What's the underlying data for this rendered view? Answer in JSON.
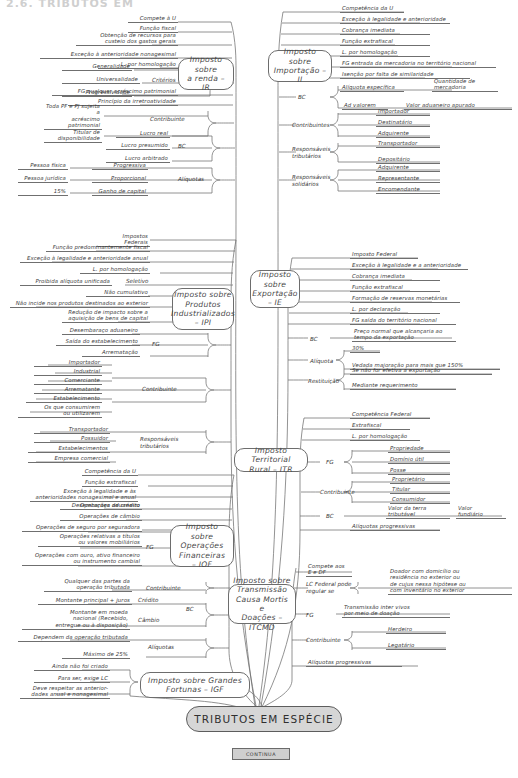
{
  "page": {
    "title_partial": "2.6. TRIBUTOS EM",
    "root_label": "TRIBUTOS EM ESPÉCIE",
    "continua_label": "CONTINUA"
  },
  "colors": {
    "ink": "#3a3a3a",
    "line": "#6f6f6f",
    "root_fill": "#d6d6d6",
    "continua_fill": "#cfcfcf",
    "paper": "#ffffff"
  },
  "branches": [
    {
      "id": "ir",
      "topic": "Imposto sobre\na renda – IR",
      "items": [
        "Compete à U",
        "Função fiscal",
        "Obtenção de recursos para\ncusteio dos gastos gerais",
        "Exceção à anterioridade nonagesimal",
        "L. por homologação",
        "FG qualquer acréscimo patrimonial",
        "Princípio da irretroatividade"
      ],
      "groups": [
        {
          "label": "Critérios",
          "children": [
            "Generalidade",
            "Universalidade",
            "Progressividade"
          ]
        },
        {
          "label": "Contribuinte",
          "children": [
            "Toda PF e PJ sujeita a\nacréscimo patrimonial",
            "Titular de disponibilidade"
          ]
        },
        {
          "label": "BC",
          "children": [
            "Lucro real",
            "Lucro presumido",
            "Lucro arbitrado"
          ]
        },
        {
          "label": "Alíquotas",
          "children": [
            "Progressiva",
            "Proporcional",
            "Ganho de capital"
          ]
        }
      ],
      "sub_leaves": [
        "Pessoa física",
        "Pessoa jurídica",
        "15%"
      ]
    },
    {
      "id": "ii",
      "topic": "Imposto sobre\nImportação – II",
      "items": [
        "Competência da U",
        "Exceção à legalidade e anterioridade",
        "Cobrança imediata",
        "Função extrafiscal",
        "L. por homologação",
        "FG entrada da mercadoria no território nacional",
        "Isenção por falta de similaridade"
      ],
      "groups": [
        {
          "label": "BC",
          "children": [
            "Alíquota específica",
            "Ad valorem"
          ],
          "values": [
            "Quantidade de\nmercadoria",
            "Valor aduaneiro apurado"
          ]
        },
        {
          "label": "Contribuintes",
          "children": [
            "Importador",
            "Destinatário",
            "Adquirente"
          ]
        },
        {
          "label": "Responsáveis\ntributários",
          "children": [
            "Transportador",
            "Depositário"
          ]
        },
        {
          "label": "Responsáveis\nsolidários",
          "children": [
            "Adquirente",
            "Representante",
            "Encomendante"
          ]
        }
      ]
    },
    {
      "id": "ipi",
      "topic": "Imposto sobre\nProdutos\nIndustrializados\n– IPI",
      "items": [
        "Impostos Federais",
        "Função predominantemente fiscal",
        "Exceção à legalidade e anterioridade anual",
        "L. por homologação",
        "Não cumulativo",
        "Não incide nos produtos destinados ao exterior",
        "Redução de impacto sobre a\naquisição de bens de capital"
      ],
      "pair": {
        "left": "Proibida alíquota unificada",
        "right": "Seletivo"
      },
      "groups": [
        {
          "label": "FG",
          "children": [
            "Desembaraço aduaneiro",
            "Saída do estabelecimento",
            "Arrematação"
          ]
        },
        {
          "label": "Contribuinte",
          "children": [
            "Importador",
            "Industrial",
            "Comerciante",
            "Arrematante",
            "Estabelecimento",
            "Os que consumirem\nou utilizarem"
          ]
        },
        {
          "label": "Responsáveis\ntributários",
          "children": [
            "Transportador",
            "Possuidor",
            "Estabelecimentos",
            "Empresa comercial"
          ]
        }
      ]
    },
    {
      "id": "ie",
      "topic": "Imposto\nsobre\nExportação\n– IE",
      "items": [
        "Imposto Federal",
        "Exceção à legalidade e a anterioridade",
        "Cobrança imediata",
        "Função extrafiscal",
        "Formação de reservas monetárias",
        "L. por declaração",
        "FG saída do território nacional"
      ],
      "groups": [
        {
          "label": "BC",
          "children": [
            "Preço normal que alcançaria ao\ntempo da exportação"
          ]
        },
        {
          "label": "Alíquota",
          "children": [
            "30%",
            "Vedada majoração para mais que 150%"
          ]
        },
        {
          "label": "Restituição",
          "children": [
            "Se não for efetiva a exportação",
            "Mediante requerimento"
          ]
        }
      ]
    },
    {
      "id": "itr",
      "topic": "Imposto Territorial\nRural – ITR",
      "items": [
        "Competência Federal",
        "Extrafiscal",
        "L. por homologação",
        "Alíquotas progressivas"
      ],
      "groups": [
        {
          "label": "FG",
          "children": [
            "Propriedade",
            "Domínio útil",
            "Posse"
          ]
        },
        {
          "label": "Contribuinte",
          "children": [
            "Proprietário",
            "Titular",
            "Consumidor"
          ]
        },
        {
          "label": "BC",
          "children": [
            "Valor da terra\ntributável",
            "Valor\nfundiário"
          ]
        }
      ]
    },
    {
      "id": "itcmd",
      "topic": "Imposto sobre\nTransmissão\nCausa Mortis e\nDoações – ITCMD",
      "items": [
        "Compete aos\nE e DF",
        "Alíquotas progressivas"
      ],
      "groups": [
        {
          "label": "LC Federal pode\nregular se",
          "children": [
            "Doador com domicílio ou\nresidência no exterior ou\nde cujus nessa hipótese ou\ncom inventário no exterior"
          ]
        },
        {
          "label": "FG",
          "children": [
            "Transmissão inter vivos\npor meio de doação"
          ]
        },
        {
          "label": "Contribuinte",
          "children": [
            "Herdeiro",
            "Legatário"
          ]
        }
      ]
    },
    {
      "id": "igf",
      "topic": "Imposto sobre Grandes\nFortunas – IGF",
      "items": [
        "Ainda não foi criado",
        "Para ser, exige LC",
        "Deve respeitar as anterior-\ndades anual e nonagesimal"
      ],
      "groups": []
    }
  ]
}
